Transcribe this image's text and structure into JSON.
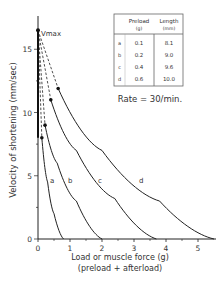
{
  "chart_data": {
    "type": "line",
    "title": "",
    "xlabel": "Load or muscle force (g)",
    "xlabel2": "(preload + afterload)",
    "ylabel": "Velocity of shortening (mm/sec)",
    "xlim": [
      0,
      5.6
    ],
    "ylim": [
      0,
      17.5
    ],
    "xticks": [
      "0",
      "1",
      "2",
      "3",
      "4",
      "5"
    ],
    "yticks": [
      "0",
      "5",
      "10",
      "15"
    ],
    "vmax_label": "Vmax",
    "vmax": 16.5,
    "grid": false,
    "series": [
      {
        "name": "a",
        "preload": 0.1,
        "length": 8.1,
        "dot": [
          0.12,
          8.0
        ],
        "x": [
          0.12,
          0.3,
          0.5,
          0.8
        ],
        "y": [
          8.0,
          4.5,
          2.0,
          0.0
        ]
      },
      {
        "name": "b",
        "preload": 0.2,
        "length": 9.0,
        "dot": [
          0.22,
          9.0
        ],
        "x": [
          0.22,
          0.6,
          1.2,
          2.0
        ],
        "y": [
          9.0,
          6.0,
          3.0,
          0.0
        ]
      },
      {
        "name": "c",
        "preload": 0.4,
        "length": 9.6,
        "dot": [
          0.4,
          11.0
        ],
        "x": [
          0.4,
          1.2,
          2.4,
          3.7
        ],
        "y": [
          11.0,
          7.0,
          3.2,
          0.0
        ]
      },
      {
        "name": "d",
        "preload": 0.6,
        "length": 10.0,
        "dot": [
          0.63,
          11.9
        ],
        "x": [
          0.63,
          2.0,
          3.8,
          5.5
        ],
        "y": [
          11.9,
          7.0,
          3.0,
          0.0
        ]
      }
    ]
  },
  "table": {
    "headers": [
      "Preload",
      "Length"
    ],
    "units": [
      "(g)",
      "(mm)"
    ],
    "rows": [
      {
        "label": "a",
        "preload": "0.1",
        "length": "8.1"
      },
      {
        "label": "b",
        "preload": "0.2",
        "length": "9.0"
      },
      {
        "label": "c",
        "preload": "0.4",
        "length": "9.6"
      },
      {
        "label": "d",
        "preload": "0.6",
        "length": "10.0"
      }
    ]
  },
  "rate_label": "Rate = 30/min."
}
